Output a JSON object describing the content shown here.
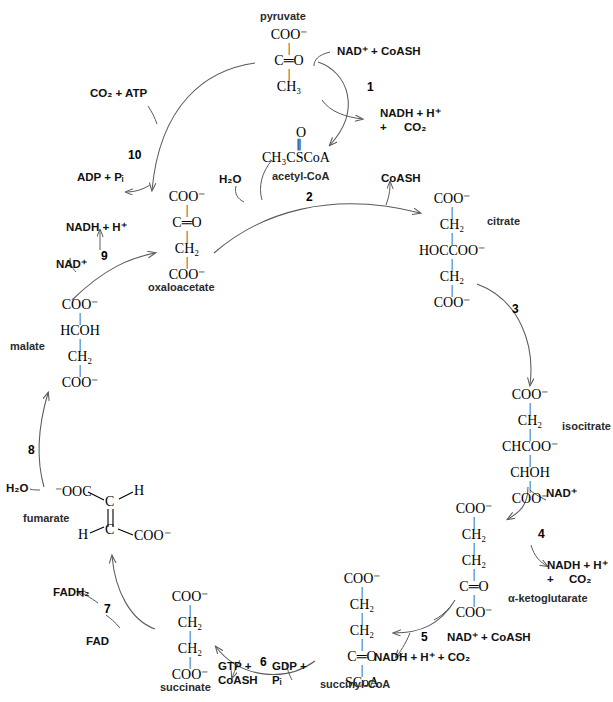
{
  "diagram": {
    "type": "metabolic-cycle"
  },
  "molecules": {
    "pyruvate": {
      "name": "pyruvate",
      "rows": [
        "COO⁻",
        "C═O",
        "CH₃"
      ]
    },
    "acetyl_coa": {
      "name": "acetyl-CoA",
      "carbonyl": "O",
      "backbone": "CH₃CSCoA"
    },
    "oxaloacetate": {
      "name": "oxaloacetate",
      "rows": [
        "COO⁻",
        "C═O",
        "CH₂",
        "COO⁻"
      ]
    },
    "citrate": {
      "name": "citrate",
      "rows": [
        "COO⁻",
        "CH₂",
        "HOCCOO⁻",
        "CH₂",
        "COO⁻"
      ]
    },
    "isocitrate": {
      "name": "isocitrate",
      "rows": [
        "COO⁻",
        "CH₂",
        "CHCOO⁻",
        "CHOH",
        "COO⁻"
      ]
    },
    "alpha_ketoglutarate": {
      "name": "α-ketoglutarate",
      "rows": [
        "COO⁻",
        "CH₂",
        "CH₂",
        "C═O",
        "COO⁻"
      ]
    },
    "succinyl_coa": {
      "name": "succinyl-CoA",
      "rows": [
        "COO⁻",
        "CH₂",
        "CH₂",
        "C═O",
        "SCoA"
      ]
    },
    "succinate": {
      "name": "succinate",
      "rows": [
        "COO⁻",
        "CH₂",
        "CH₂",
        "COO⁻"
      ]
    },
    "fumarate": {
      "name": "fumarate",
      "left_carboxyl": "⁻OOC",
      "top_carbon": "C",
      "top_hydrogen": "H",
      "bottom_carbon": "C",
      "bottom_hydrogen": "H",
      "right_carboxyl": "COO⁻"
    },
    "malate": {
      "name": "malate",
      "rows": [
        "COO⁻",
        "HCOH",
        "CH₂",
        "COO⁻"
      ]
    }
  },
  "steps": [
    {
      "number": "1",
      "reactants": "NAD⁺ + CoASH",
      "products_line1": "NADH + H⁺",
      "products_line2": "+",
      "products_line3": "CO₂",
      "from": "pyruvate",
      "to": "acetyl-CoA"
    },
    {
      "number": "2",
      "reactants": "H₂O",
      "products_line1": "CoASH",
      "from": "oxaloacetate + acetyl-CoA",
      "to": "citrate"
    },
    {
      "number": "3",
      "reactants": "",
      "products_line1": "",
      "from": "citrate",
      "to": "isocitrate"
    },
    {
      "number": "4",
      "reactants": "NAD⁺",
      "products_line1": "NADH + H⁺",
      "products_line2": "+",
      "products_line3": "CO₂",
      "from": "isocitrate",
      "to": "α-ketoglutarate"
    },
    {
      "number": "5",
      "reactants": "NAD⁺ + CoASH",
      "products_line1": "NADH + H⁺ + CO₂",
      "from": "α-ketoglutarate",
      "to": "succinyl-CoA"
    },
    {
      "number": "6",
      "reactants_line1": "GDP +",
      "reactants_line2": "Pᵢ",
      "products_line1": "GTP +",
      "products_line2": "CoASH",
      "from": "succinyl-CoA",
      "to": "succinate"
    },
    {
      "number": "7",
      "reactants": "FAD",
      "products_line1": "FADH₂",
      "from": "succinate",
      "to": "fumarate"
    },
    {
      "number": "8",
      "reactants": "H₂O",
      "products_line1": "",
      "from": "fumarate",
      "to": "malate"
    },
    {
      "number": "9",
      "reactants": "NAD⁺",
      "products_line1": "NADH + H⁺",
      "from": "malate",
      "to": "oxaloacetate"
    },
    {
      "number": "10",
      "reactants": "CO₂ + ATP",
      "products_line1": "ADP + Pᵢ",
      "from": "pyruvate",
      "to": "oxaloacetate"
    }
  ],
  "colors": {
    "stroke": "#5a5a5a",
    "text": "#111111",
    "background": "#ffffff"
  }
}
